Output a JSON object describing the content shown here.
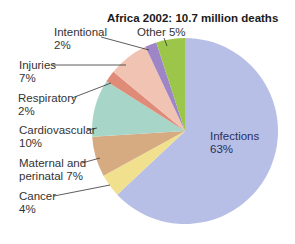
{
  "chart_data": {
    "type": "pie",
    "title": "Africa 2002: 10.7 million deaths",
    "start_angle_deg": 0,
    "direction": "clockwise",
    "slices": [
      {
        "label": "Infections",
        "value": 63,
        "display": "63%",
        "color": "#b8bfe6"
      },
      {
        "label": "Cancer",
        "value": 4,
        "display": "4%",
        "color": "#f1e08e"
      },
      {
        "label": "Maternal and perinatal",
        "value": 7,
        "display": "7%",
        "color": "#d6ab82"
      },
      {
        "label": "Cardiovascular",
        "value": 10,
        "display": "10%",
        "color": "#a7d6c8"
      },
      {
        "label": "Respiratory",
        "value": 2,
        "display": "2%",
        "color": "#e08a78"
      },
      {
        "label": "Injuries",
        "value": 7,
        "display": "7%",
        "color": "#f1c3b3"
      },
      {
        "label": "Intentional",
        "value": 2,
        "display": "2%",
        "color": "#9e86c6"
      },
      {
        "label": "Other",
        "value": 5,
        "display": "5%",
        "color": "#9cc64a"
      }
    ]
  },
  "labels": {
    "infections": [
      "Infections",
      "63%"
    ],
    "cancer": [
      "Cancer",
      "4%"
    ],
    "maternal": [
      "Maternal and",
      "perinatal 7%"
    ],
    "cardiovascular": [
      "Cardiovascular",
      "10%"
    ],
    "respiratory": [
      "Respiratory",
      "2%"
    ],
    "injuries": [
      "Injuries",
      "7%"
    ],
    "intentional": [
      "Intentional",
      "2%"
    ],
    "other": "Other 5%"
  }
}
